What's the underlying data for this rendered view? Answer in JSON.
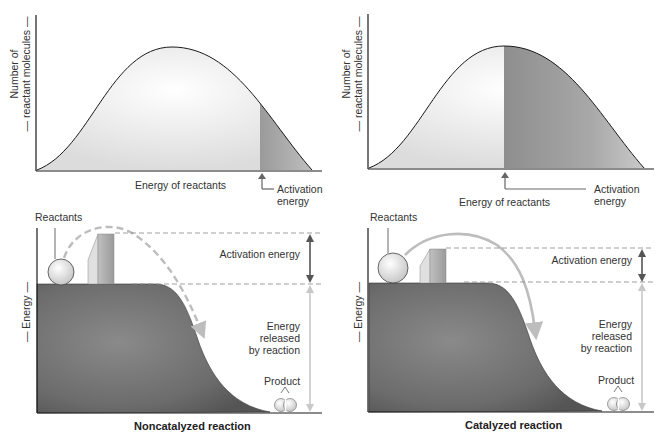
{
  "panels": {
    "top_left": {
      "y_label_line1": "Number of",
      "y_label_line2": "— reactant molecules —",
      "x_label": "Energy of reactants",
      "activation_label_line1": "Activation",
      "activation_label_line2": "energy"
    },
    "top_right": {
      "y_label_line1": "Number of",
      "y_label_line2": "— reactant molecules —",
      "x_label": "Energy of reactants",
      "activation_label_line1": "Activation",
      "activation_label_line2": "energy"
    },
    "bottom_left": {
      "y_label": "— Energy —",
      "reactants_label": "Reactants",
      "activation_label": "Activation energy",
      "released_line1": "Energy",
      "released_line2": "released",
      "released_line3": "by reaction",
      "product_label": "Product",
      "title": "Noncatalyzed reaction"
    },
    "bottom_right": {
      "y_label": "— Energy —",
      "reactants_label": "Reactants",
      "activation_label": "Activation energy",
      "released_line1": "Energy",
      "released_line2": "released",
      "released_line3": "by reaction",
      "product_label": "Product",
      "title": "Catalyzed reaction"
    }
  },
  "colors": {
    "axis": "#1a1a1a",
    "curve_fill_light": "#f2f2f2",
    "shaded_region": "#9a9a9a",
    "plateau": "#6e6e6e",
    "dashed": "#888888",
    "arrow_dark": "#555555",
    "arrow_light": "#c8c8c8"
  }
}
